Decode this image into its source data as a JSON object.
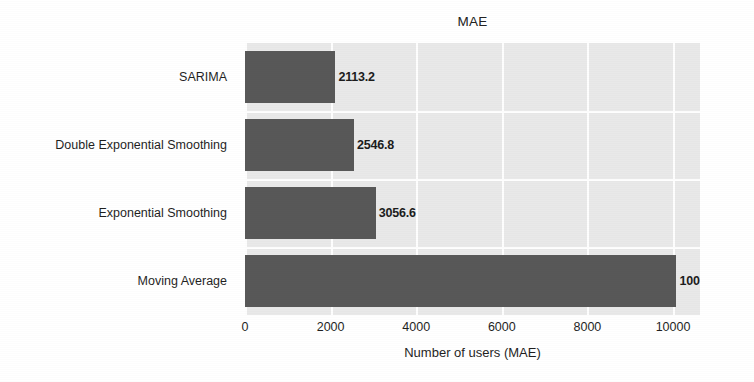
{
  "chart_data": {
    "type": "bar",
    "orientation": "horizontal",
    "title": "MAE",
    "xlabel": "Number of users (MAE)",
    "ylabel": "",
    "categories": [
      "Moving Average",
      "Exponential Smoothing",
      "Double Exponential Smoothing",
      "SARIMA"
    ],
    "values": [
      10079.3,
      3056.6,
      2546.8,
      2113.2
    ],
    "data_labels": [
      "10079.3",
      "3056.6",
      "2546.8",
      "2113.2"
    ],
    "xticks": [
      0,
      2000,
      4000,
      6000,
      8000,
      10000
    ],
    "xtick_labels": [
      "0",
      "2000",
      "4000",
      "6000",
      "8000",
      "10000"
    ],
    "xlim": [
      0,
      10630
    ],
    "grid": true,
    "grid_axis": "both",
    "legend": false,
    "bar_color": "#585858",
    "plot_background": "#e9e9e9",
    "grid_color": "#ffffff",
    "figure_background": "#ffffff"
  },
  "bars": [
    {
      "category": "SARIMA",
      "value": 2113.2,
      "label": "2113.2"
    },
    {
      "category": "Double Exponential Smoothing",
      "value": 2546.8,
      "label": "2546.8"
    },
    {
      "category": "Exponential Smoothing",
      "value": 3056.6,
      "label": "3056.6"
    },
    {
      "category": "Moving Average",
      "value": 10079.3,
      "label": "10079.3"
    }
  ]
}
